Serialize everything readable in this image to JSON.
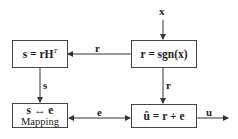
{
  "diagram": {
    "input_label": "x",
    "output_label": "u",
    "blocks": {
      "syndrome": {
        "text": "s = rH",
        "sup": "T"
      },
      "hard_decision": {
        "text": "r = sgn(x)"
      },
      "mapping": {
        "line1": "s ↔ e",
        "line2": "Mapping"
      },
      "correction": {
        "text": "û = r + e"
      }
    },
    "edges": {
      "r_to_syndrome": "r",
      "s_to_mapping": "s",
      "r_to_correction": "r",
      "e_mapping_correction": "e"
    }
  }
}
